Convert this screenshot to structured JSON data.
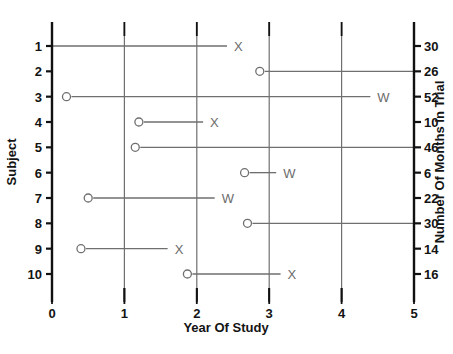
{
  "chart_data": {
    "type": "scatter",
    "title": "",
    "xlabel": "Year Of Study",
    "ylabel": "Subject",
    "y2label": "Number Of Months in Trial",
    "xlim": [
      0,
      5
    ],
    "xticks": [
      "0",
      "1",
      "2",
      "3",
      "4",
      "5"
    ],
    "ylim": [
      1,
      10
    ],
    "yticks": [
      "1",
      "2",
      "3",
      "4",
      "5",
      "6",
      "7",
      "8",
      "9",
      "10"
    ],
    "y2ticks": [
      "30",
      "26",
      "52",
      "10",
      "46",
      "6",
      "22",
      "30",
      "14",
      "16"
    ],
    "grid": true,
    "grid_axis": "x",
    "legend": "none",
    "marker_meanings": {
      "O": "entry / randomization",
      "X": "event",
      "W": "withdrawn"
    },
    "series": [
      {
        "subject": "1",
        "months_in_trial": "30",
        "start": 0,
        "end": 2.5,
        "start_marker": "",
        "end_marker": "X"
      },
      {
        "subject": "2",
        "months_in_trial": "26",
        "start": 2.87,
        "end": 5,
        "start_marker": "O",
        "end_marker": ""
      },
      {
        "subject": "3",
        "months_in_trial": "52",
        "start": 0.2,
        "end": 4.48,
        "start_marker": "O",
        "end_marker": "W"
      },
      {
        "subject": "4",
        "months_in_trial": "10",
        "start": 1.2,
        "end": 2.17,
        "start_marker": "O",
        "end_marker": "X"
      },
      {
        "subject": "5",
        "months_in_trial": "46",
        "start": 1.15,
        "end": 5,
        "start_marker": "O",
        "end_marker": ""
      },
      {
        "subject": "6",
        "months_in_trial": "6",
        "start": 2.66,
        "end": 3.18,
        "start_marker": "O",
        "end_marker": "W"
      },
      {
        "subject": "7",
        "months_in_trial": "22",
        "start": 0.5,
        "end": 2.33,
        "start_marker": "O",
        "end_marker": "W"
      },
      {
        "subject": "8",
        "months_in_trial": "30",
        "start": 2.7,
        "end": 5,
        "start_marker": "O",
        "end_marker": ""
      },
      {
        "subject": "9",
        "months_in_trial": "14",
        "start": 0.4,
        "end": 1.68,
        "start_marker": "O",
        "end_marker": "X"
      },
      {
        "subject": "10",
        "months_in_trial": "16",
        "start": 1.87,
        "end": 3.24,
        "start_marker": "O",
        "end_marker": "X"
      }
    ]
  }
}
